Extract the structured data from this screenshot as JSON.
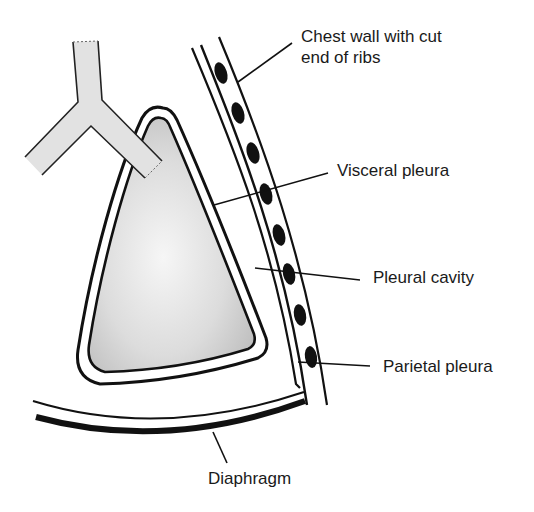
{
  "diagram": {
    "labels": {
      "chest_wall_line1": "Chest wall with cut",
      "chest_wall_line2": "end of ribs",
      "visceral_pleura": "Visceral pleura",
      "pleural_cavity": "Pleural cavity",
      "parietal_pleura": "Parietal pleura",
      "diaphragm": "Diaphragm"
    },
    "structures": [
      "bronchus",
      "lung",
      "visceral pleura",
      "pleural cavity",
      "parietal pleura",
      "chest wall",
      "ribs",
      "diaphragm"
    ],
    "rib_count": 8,
    "colors": {
      "line": "#111111",
      "lung_fill_light": "#f4f4f4",
      "lung_fill_dark": "#bdbdbd",
      "bronchus_fill": "#e2e2e2",
      "background": "#ffffff"
    }
  }
}
